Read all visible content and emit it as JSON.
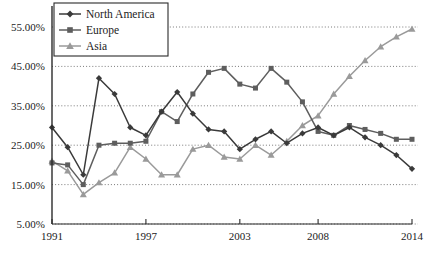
{
  "chart_data": {
    "type": "line",
    "title": "",
    "subtitle": "",
    "xlabel": "",
    "ylabel": "",
    "grid": true,
    "legend_position": "top-left",
    "xlim": [
      1991,
      2014
    ],
    "ylim": [
      5,
      55
    ],
    "y_tick_labels": [
      "55.00%",
      "45.00%",
      "35.00%",
      "25.00%",
      "15.00%",
      "5.00%"
    ],
    "y_ticks": [
      55,
      45,
      35,
      25,
      15,
      5
    ],
    "x_tick_labels": [
      "1991",
      "1997",
      "2003",
      "2008",
      "2014"
    ],
    "x_ticks": [
      1991,
      1997,
      2003,
      2008,
      2014
    ],
    "x": [
      1991,
      1992,
      1993,
      1994,
      1995,
      1996,
      1997,
      1998,
      1999,
      2000,
      2001,
      2002,
      2003,
      2004,
      2005,
      2006,
      2007,
      2008,
      2009,
      2010,
      2011,
      2012,
      2013,
      2014
    ],
    "series": [
      {
        "name": "North America",
        "marker": "diamond",
        "color": "#3a3a3a",
        "values": [
          29.5,
          24.5,
          17.5,
          42.0,
          38.0,
          29.5,
          27.5,
          33.5,
          38.5,
          33.0,
          29.0,
          28.5,
          24.0,
          26.5,
          28.5,
          25.5,
          28.0,
          29.5,
          27.5,
          29.5,
          27.0,
          25.0,
          22.5,
          19.0
        ]
      },
      {
        "name": "Europe",
        "marker": "square",
        "color": "#5e5e5e",
        "values": [
          20.5,
          20.0,
          15.0,
          25.0,
          25.5,
          25.5,
          26.0,
          33.5,
          31.0,
          38.0,
          43.5,
          44.5,
          40.5,
          39.5,
          44.5,
          41.0,
          36.0,
          28.5,
          27.5,
          30.0,
          29.0,
          28.0,
          26.5,
          26.5
        ]
      },
      {
        "name": "Asia",
        "marker": "triangle",
        "color": "#9a9a9a",
        "values": [
          21.0,
          18.5,
          12.5,
          15.5,
          18.0,
          24.5,
          21.5,
          17.5,
          17.5,
          24.0,
          25.0,
          22.0,
          21.5,
          25.0,
          22.5,
          26.0,
          30.0,
          32.5,
          38.0,
          42.5,
          46.5,
          50.0,
          52.5,
          54.5
        ]
      }
    ]
  },
  "legend": {
    "items": [
      {
        "label": "North America",
        "marker": "diamond",
        "color": "#3a3a3a"
      },
      {
        "label": "Europe",
        "marker": "square",
        "color": "#5e5e5e"
      },
      {
        "label": "Asia",
        "marker": "triangle",
        "color": "#9a9a9a"
      }
    ]
  },
  "axes": {
    "axis_color": "#2b2b2b",
    "grid_color": "#6b6b6b"
  }
}
